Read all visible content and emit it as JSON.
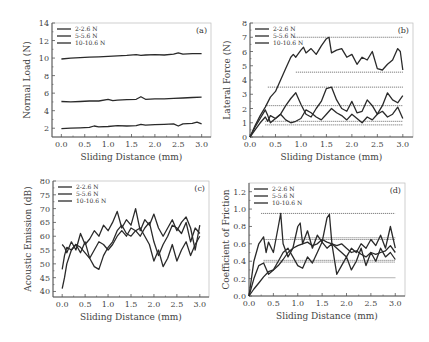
{
  "chart_data": [
    {
      "id": "a",
      "type": "line",
      "panel_label": "(a)",
      "xlabel": "Sliding Distance (mm)",
      "ylabel": "Normal Load (N)",
      "xlim": [
        -0.2,
        3.2
      ],
      "ylim": [
        1,
        14
      ],
      "xticks": [
        0.0,
        0.5,
        1.0,
        1.5,
        2.0,
        2.5,
        3.0
      ],
      "xtick_labels": [
        "0.0",
        "0.5",
        "1.0",
        "1.5",
        "2.0",
        "2.5",
        "3.0"
      ],
      "yticks": [
        2,
        4,
        6,
        8,
        10,
        12,
        14
      ],
      "ytick_labels": [
        "2",
        "4",
        "6",
        "8",
        "10",
        "12",
        "14"
      ],
      "legend": [
        "2-2.6 N",
        "5-5.6 N",
        "10-10.6 N"
      ],
      "frame": {
        "x0": 52,
        "y0": 23,
        "x1": 211,
        "y1": 137
      },
      "series": [
        {
          "name": "2-2.6 N",
          "x": [
            0,
            0.2,
            0.4,
            0.6,
            0.7,
            0.8,
            1.0,
            1.2,
            1.4,
            1.6,
            1.7,
            1.8,
            2.0,
            2.2,
            2.4,
            2.5,
            2.6,
            2.8,
            2.9,
            3.0
          ],
          "y": [
            1.95,
            2.0,
            2.05,
            2.1,
            2.25,
            2.15,
            2.2,
            2.3,
            2.25,
            2.3,
            2.45,
            2.35,
            2.4,
            2.45,
            2.5,
            2.25,
            2.5,
            2.55,
            2.7,
            2.5
          ]
        },
        {
          "name": "5-5.6 N",
          "x": [
            0,
            0.2,
            0.4,
            0.6,
            0.8,
            1.0,
            1.1,
            1.2,
            1.4,
            1.6,
            1.7,
            1.8,
            2.0,
            2.2,
            2.4,
            2.6,
            2.8,
            3.0
          ],
          "y": [
            5.05,
            5.0,
            5.05,
            5.1,
            5.1,
            5.3,
            5.15,
            5.2,
            5.25,
            5.3,
            5.6,
            5.3,
            5.35,
            5.35,
            5.4,
            5.45,
            5.5,
            5.55
          ]
        },
        {
          "name": "10-10.6 N",
          "x": [
            0,
            0.2,
            0.4,
            0.6,
            0.8,
            1.0,
            1.2,
            1.4,
            1.6,
            1.7,
            1.8,
            2.0,
            2.2,
            2.4,
            2.5,
            2.6,
            2.8,
            3.0
          ],
          "y": [
            9.9,
            10.0,
            10.05,
            10.1,
            10.15,
            10.2,
            10.25,
            10.3,
            10.4,
            10.3,
            10.35,
            10.4,
            10.35,
            10.45,
            10.6,
            10.45,
            10.5,
            10.5
          ]
        }
      ],
      "reference_lines": []
    },
    {
      "id": "b",
      "type": "line",
      "panel_label": "(b)",
      "xlabel": "Sliding Distance (mm)",
      "ylabel": "Lateral Force (N)",
      "xlim": [
        0,
        3.2
      ],
      "ylim": [
        0,
        8
      ],
      "xticks": [
        0.0,
        0.5,
        1.0,
        1.5,
        2.0,
        2.5,
        3.0
      ],
      "xtick_labels": [
        "0.0",
        "0.5",
        "1.0",
        "1.5",
        "2.0",
        "2.5",
        "3.0"
      ],
      "yticks": [
        0,
        1,
        2,
        3,
        4,
        5,
        6,
        7,
        8
      ],
      "ytick_labels": [
        "0",
        "1",
        "2",
        "3",
        "4",
        "5",
        "6",
        "7",
        "8"
      ],
      "legend": [
        "2-2.6 N",
        "5-5.6 N",
        "10-10.6 N"
      ],
      "frame": {
        "x0": 250,
        "y0": 23,
        "x1": 413,
        "y1": 137
      },
      "series": [
        {
          "name": "2-2.6 N",
          "x": [
            0,
            0.1,
            0.2,
            0.3,
            0.35,
            0.4,
            0.5,
            0.6,
            0.7,
            0.8,
            0.9,
            1.0,
            1.1,
            1.2,
            1.3,
            1.4,
            1.5,
            1.6,
            1.7,
            1.8,
            1.9,
            2.0,
            2.1,
            2.2,
            2.3,
            2.4,
            2.5,
            2.6,
            2.7,
            2.8,
            2.9,
            3.0
          ],
          "y": [
            0,
            0.5,
            1.0,
            1.4,
            1.1,
            1.5,
            1.3,
            1.6,
            1.2,
            1.0,
            1.1,
            1.3,
            1.9,
            1.7,
            1.4,
            1.2,
            1.6,
            2.0,
            1.7,
            1.5,
            1.2,
            1.6,
            1.3,
            1.0,
            1.4,
            1.2,
            1.6,
            1.8,
            1.4,
            1.6,
            2.1,
            1.3
          ]
        },
        {
          "name": "5-5.6 N",
          "x": [
            0,
            0.1,
            0.2,
            0.3,
            0.35,
            0.4,
            0.5,
            0.6,
            0.7,
            0.8,
            0.9,
            1.0,
            1.1,
            1.2,
            1.3,
            1.4,
            1.5,
            1.6,
            1.7,
            1.8,
            1.9,
            2.0,
            2.1,
            2.2,
            2.3,
            2.4,
            2.5,
            2.6,
            2.7,
            2.8,
            2.9,
            3.0
          ],
          "y": [
            0,
            0.7,
            1.3,
            1.9,
            1.5,
            1.0,
            1.3,
            1.6,
            2.2,
            2.7,
            3.1,
            2.3,
            1.6,
            1.4,
            2.0,
            2.5,
            3.4,
            3.5,
            2.6,
            2.0,
            1.8,
            2.5,
            1.7,
            1.8,
            2.6,
            2.2,
            1.6,
            2.2,
            3.1,
            2.6,
            2.4,
            2.9
          ]
        },
        {
          "name": "10-10.6 N",
          "x": [
            0,
            0.1,
            0.2,
            0.3,
            0.4,
            0.5,
            0.6,
            0.7,
            0.8,
            0.85,
            0.9,
            1.0,
            1.05,
            1.1,
            1.2,
            1.3,
            1.4,
            1.5,
            1.55,
            1.6,
            1.7,
            1.8,
            1.9,
            2.0,
            2.1,
            2.2,
            2.3,
            2.4,
            2.5,
            2.6,
            2.7,
            2.8,
            2.9,
            2.95,
            3.0
          ],
          "y": [
            0,
            0.8,
            1.5,
            2.1,
            2.8,
            3.2,
            4.0,
            4.8,
            5.6,
            5.8,
            5.6,
            6.1,
            6.3,
            5.9,
            6.2,
            5.8,
            6.4,
            6.9,
            7.0,
            5.9,
            6.1,
            6.2,
            5.6,
            5.8,
            5.1,
            5.6,
            5.4,
            6.0,
            4.8,
            4.7,
            5.1,
            5.4,
            6.2,
            6.0,
            4.7
          ]
        }
      ],
      "reference_lines": [
        {
          "y": 7.0,
          "x_start": 0.85
        },
        {
          "y": 4.55,
          "x_start": 0.9
        },
        {
          "y": 3.5,
          "x_start": 0.35
        },
        {
          "y": 2.2,
          "x_start": 0.3
        },
        {
          "y": 1.1,
          "x_start": 0.3
        },
        {
          "y": 0.85,
          "x_start": 0.3
        }
      ]
    },
    {
      "id": "c",
      "type": "line",
      "panel_label": "(c)",
      "xlabel": "Sliding Distance (mm)",
      "ylabel": "Acoustic Emission (dB)",
      "xlim": [
        -0.2,
        3.2
      ],
      "ylim": [
        38,
        80
      ],
      "xticks": [
        0.0,
        0.5,
        1.0,
        1.5,
        2.0,
        2.5,
        3.0
      ],
      "xtick_labels": [
        "0.0",
        "0.5",
        "1.0",
        "1.5",
        "2.0",
        "2.5",
        "3.0"
      ],
      "yticks": [
        40,
        45,
        50,
        55,
        60,
        65,
        70,
        75,
        80
      ],
      "ytick_labels": [
        "40",
        "45",
        "50",
        "55",
        "60",
        "65",
        "70",
        "75",
        "80"
      ],
      "legend": [
        "2-2.6 N",
        "5-5.6 N",
        "10-10.6 N"
      ],
      "frame": {
        "x0": 53,
        "y0": 181,
        "x1": 209,
        "y1": 297
      },
      "series": [
        {
          "name": "2-2.6 N",
          "x": [
            0,
            0.05,
            0.1,
            0.2,
            0.3,
            0.4,
            0.5,
            0.6,
            0.7,
            0.8,
            0.9,
            1.0,
            1.1,
            1.2,
            1.3,
            1.4,
            1.5,
            1.6,
            1.7,
            1.8,
            1.9,
            2.0,
            2.1,
            2.2,
            2.3,
            2.4,
            2.5,
            2.6,
            2.7,
            2.8,
            2.9,
            3.0
          ],
          "y": [
            41,
            45,
            50,
            55,
            57,
            56,
            54,
            52,
            49,
            48,
            53,
            56,
            58,
            62,
            64,
            61,
            60,
            62,
            63,
            60,
            57,
            51,
            55,
            49,
            52,
            57,
            51,
            55,
            58,
            53,
            57,
            60
          ]
        },
        {
          "name": "5-5.6 N",
          "x": [
            0,
            0.05,
            0.1,
            0.2,
            0.3,
            0.4,
            0.5,
            0.6,
            0.7,
            0.8,
            0.9,
            1.0,
            1.1,
            1.2,
            1.3,
            1.4,
            1.5,
            1.6,
            1.7,
            1.8,
            1.9,
            2.0,
            2.1,
            2.2,
            2.3,
            2.4,
            2.5,
            2.6,
            2.7,
            2.8,
            2.9,
            3.0
          ],
          "y": [
            48,
            53,
            56,
            55,
            57,
            54,
            58,
            52,
            55,
            58,
            57,
            55,
            57,
            60,
            62,
            60,
            63,
            62,
            60,
            63,
            65,
            58,
            53,
            57,
            60,
            64,
            63,
            61,
            65,
            58,
            63,
            61
          ]
        },
        {
          "name": "10-10.6 N",
          "x": [
            0,
            0.05,
            0.1,
            0.2,
            0.3,
            0.4,
            0.5,
            0.6,
            0.7,
            0.8,
            0.9,
            1.0,
            1.1,
            1.2,
            1.3,
            1.4,
            1.5,
            1.6,
            1.7,
            1.8,
            1.9,
            2.0,
            2.1,
            2.2,
            2.3,
            2.4,
            2.5,
            2.6,
            2.7,
            2.8,
            2.9,
            3.0
          ],
          "y": [
            57,
            56,
            54,
            58,
            55,
            61,
            57,
            59,
            62,
            60,
            64,
            62,
            65,
            69,
            63,
            66,
            64,
            70,
            62,
            66,
            64,
            68,
            63,
            60,
            63,
            66,
            62,
            65,
            67,
            63,
            55,
            64
          ]
        }
      ],
      "reference_lines": []
    },
    {
      "id": "d",
      "type": "line",
      "panel_label": "(d)",
      "xlabel": "Sliding Distance (mm)",
      "ylabel": "Coefficient of Friction",
      "xlim": [
        0,
        3.2
      ],
      "ylim": [
        0,
        1.3
      ],
      "xticks": [
        0.0,
        0.5,
        1.0,
        1.5,
        2.0,
        2.5,
        3.0
      ],
      "xtick_labels": [
        "0.0",
        "0.5",
        "1.0",
        "1.5",
        "2.0",
        "2.5",
        "3.0"
      ],
      "yticks": [
        0.0,
        0.2,
        0.4,
        0.6,
        0.8,
        1.0,
        1.2
      ],
      "ytick_labels": [
        "0.0",
        "0.2",
        "0.4",
        "0.6",
        "0.8",
        "1.0",
        "1.2"
      ],
      "legend": [
        "2-2.6 N",
        "5-5.6 N",
        "10-10.6 N"
      ],
      "frame": {
        "x0": 249,
        "y0": 183,
        "x1": 405,
        "y1": 296
      },
      "series": [
        {
          "name": "2-2.6 N",
          "x": [
            0,
            0.1,
            0.2,
            0.3,
            0.35,
            0.4,
            0.5,
            0.6,
            0.65,
            0.7,
            0.8,
            0.9,
            1.0,
            1.05,
            1.1,
            1.2,
            1.3,
            1.4,
            1.5,
            1.6,
            1.65,
            1.7,
            1.8,
            1.9,
            2.0,
            2.1,
            2.2,
            2.3,
            2.4,
            2.5,
            2.6,
            2.7,
            2.8,
            2.9,
            3.0
          ],
          "y": [
            0,
            0.4,
            0.6,
            0.68,
            0.5,
            0.62,
            0.5,
            0.8,
            0.95,
            0.6,
            0.45,
            0.55,
            0.8,
            0.84,
            0.6,
            0.75,
            0.55,
            0.7,
            0.62,
            0.9,
            0.94,
            0.6,
            0.55,
            0.5,
            0.45,
            0.55,
            0.5,
            0.6,
            0.55,
            0.65,
            0.58,
            0.7,
            0.55,
            0.8,
            0.55
          ]
        },
        {
          "name": "5-5.6 N",
          "x": [
            0,
            0.1,
            0.2,
            0.3,
            0.4,
            0.5,
            0.6,
            0.7,
            0.8,
            0.9,
            1.0,
            1.1,
            1.2,
            1.3,
            1.4,
            1.5,
            1.6,
            1.7,
            1.8,
            1.9,
            2.0,
            2.1,
            2.2,
            2.3,
            2.4,
            2.5,
            2.6,
            2.7,
            2.8,
            2.9,
            3.0
          ],
          "y": [
            0,
            0.2,
            0.35,
            0.38,
            0.25,
            0.3,
            0.4,
            0.5,
            0.55,
            0.45,
            0.35,
            0.32,
            0.45,
            0.38,
            0.5,
            0.62,
            0.55,
            0.6,
            0.25,
            0.35,
            0.45,
            0.3,
            0.4,
            0.55,
            0.35,
            0.5,
            0.4,
            0.55,
            0.45,
            0.5,
            0.42
          ]
        },
        {
          "name": "10-10.6 N",
          "x": [
            0,
            0.1,
            0.2,
            0.3,
            0.4,
            0.5,
            0.6,
            0.7,
            0.8,
            0.9,
            1.0,
            1.1,
            1.2,
            1.3,
            1.4,
            1.5,
            1.6,
            1.7,
            1.8,
            1.9,
            2.0,
            2.1,
            2.2,
            2.3,
            2.4,
            2.5,
            2.6,
            2.7,
            2.8,
            2.9,
            3.0
          ],
          "y": [
            0,
            0.08,
            0.15,
            0.22,
            0.28,
            0.3,
            0.35,
            0.42,
            0.5,
            0.55,
            0.58,
            0.6,
            0.62,
            0.58,
            0.6,
            0.65,
            0.62,
            0.6,
            0.58,
            0.6,
            0.55,
            0.5,
            0.52,
            0.48,
            0.45,
            0.5,
            0.48,
            0.5,
            0.52,
            0.58,
            0.5
          ]
        }
      ],
      "reference_lines": [
        {
          "y": 0.95,
          "x_start": 0.25
        },
        {
          "y": 0.67,
          "x_start": 0.85
        },
        {
          "y": 0.65,
          "x_start": 0.3
        },
        {
          "y": 0.41,
          "x_start": 0.3
        },
        {
          "y": 0.39,
          "x_start": 0.3
        },
        {
          "y": 0.21,
          "x_start": 0.4
        }
      ]
    }
  ],
  "colors": {
    "line": "#2a2a2a",
    "axis": "#555555",
    "ref_line": "#666666"
  }
}
